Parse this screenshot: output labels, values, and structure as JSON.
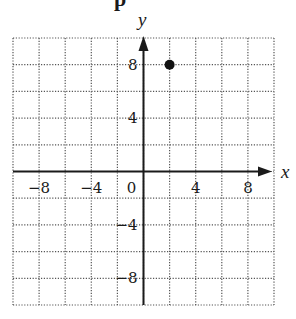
{
  "header": {
    "cut_off_text": "p"
  },
  "chart_data": {
    "type": "scatter",
    "title": "",
    "xlabel": "x",
    "ylabel": "y",
    "xlim": [
      -10,
      10
    ],
    "ylim": [
      -10,
      10
    ],
    "grid": true,
    "grid_style": "dotted",
    "grid_step": 2,
    "x_ticks": [
      {
        "value": -8,
        "label": "−8"
      },
      {
        "value": -4,
        "label": "−4"
      },
      {
        "value": 0,
        "label": "0"
      },
      {
        "value": 4,
        "label": "4"
      },
      {
        "value": 8,
        "label": "8"
      }
    ],
    "y_ticks": [
      {
        "value": 8,
        "label": "8"
      },
      {
        "value": 4,
        "label": "4"
      },
      {
        "value": -4,
        "label": "−4"
      },
      {
        "value": -8,
        "label": "−8"
      }
    ],
    "series": [
      {
        "name": "point",
        "points": [
          {
            "x": 2,
            "y": 8
          }
        ]
      }
    ],
    "legend": null
  },
  "colors": {
    "axis": "#1a1a1a",
    "grid": "#555555",
    "point": "#111111"
  }
}
